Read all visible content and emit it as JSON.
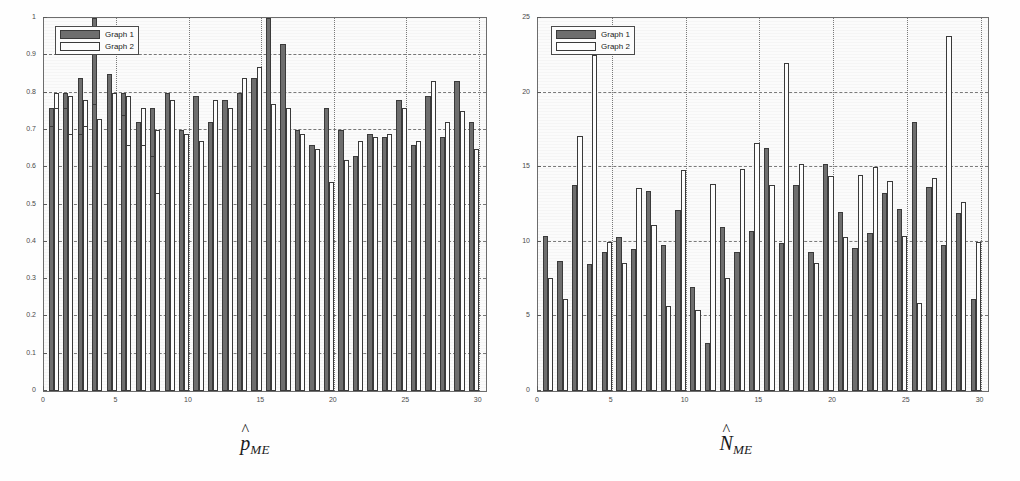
{
  "figure": {
    "background": "#fefefe",
    "series_colors": {
      "graph1": "#6e6e6e",
      "graph2": "#fdfdfd"
    },
    "grid_color": "#7a7a7a",
    "axis_color": "#6d6d6d"
  },
  "legend": {
    "entries": [
      {
        "label": "Graph 1",
        "key": "s1"
      },
      {
        "label": "Graph 2",
        "key": "s2"
      }
    ]
  },
  "panels": [
    {
      "id": "left",
      "caption_symbol": "p",
      "caption_hat": "^",
      "caption_sub": "ME"
    },
    {
      "id": "right",
      "caption_symbol": "N",
      "caption_hat": "^",
      "caption_sub": "ME"
    }
  ],
  "chart_data": [
    {
      "type": "bar",
      "id": "p-hat-me",
      "title": "",
      "xlabel": "",
      "ylabel": "",
      "xlim": [
        0,
        30.5
      ],
      "ylim": [
        0,
        1
      ],
      "xticks": [
        0,
        5,
        10,
        15,
        20,
        25,
        30
      ],
      "yticks": [
        0,
        0.1,
        0.2,
        0.3,
        0.4,
        0.5,
        0.6,
        0.7,
        0.8,
        0.9,
        1
      ],
      "xtick_labels": [
        "0",
        "5",
        "10",
        "15",
        "20",
        "25",
        "30"
      ],
      "ytick_labels": [
        "0",
        "0.1",
        "0.2",
        "0.3",
        "0.4",
        "0.5",
        "0.6",
        "0.7",
        "0.8",
        "0.9",
        "1"
      ],
      "grid": true,
      "legend_position": "upper-left",
      "categories": [
        1,
        2,
        3,
        4,
        5,
        6,
        7,
        8,
        9,
        10,
        11,
        12,
        13,
        14,
        15,
        16,
        17,
        18,
        19,
        20,
        21,
        22,
        23,
        24,
        25,
        26,
        27,
        28,
        29,
        30
      ],
      "series": [
        {
          "name": "Graph 1",
          "color": "#6e6e6e",
          "values": [
            0.76,
            0.8,
            0.84,
            1.0,
            0.66,
            0.8,
            0.59,
            0.76,
            0.71,
            0.7,
            0.79,
            0.72,
            0.78,
            0.8,
            0.84,
            1.0,
            0.93,
            0.7,
            0.66,
            0.76,
            0.7,
            0.63,
            0.69,
            0.68,
            0.78,
            0.66,
            0.79,
            0.68,
            0.83,
            0.72,
            0.71,
            0.76,
            0.69,
            0.77,
            0.85,
            0.74,
            0.72,
            0.63,
            0.8,
            0.7
          ]
        },
        {
          "name": "Graph 2",
          "color": "#fdfdfd",
          "values": [
            0.8,
            0.79,
            0.78,
            0.67,
            0.58,
            0.79,
            0.76,
            0.7,
            0.69,
            0.67,
            0.67,
            0.78,
            0.76,
            0.84,
            0.87,
            0.77,
            0.76,
            0.69,
            0.65,
            0.56,
            0.62,
            0.67,
            0.68,
            0.69,
            0.76,
            0.67,
            0.83,
            0.72,
            0.75,
            0.65,
            0.76,
            0.69,
            0.71,
            0.73,
            0.8,
            0.66,
            0.66,
            0.53,
            0.78,
            0.69
          ]
        }
      ]
    },
    {
      "type": "bar",
      "id": "n-hat-me",
      "title": "",
      "xlabel": "",
      "ylabel": "",
      "xlim": [
        0,
        30.5
      ],
      "ylim": [
        0,
        25
      ],
      "xticks": [
        0,
        5,
        10,
        15,
        20,
        25,
        30
      ],
      "yticks": [
        0,
        5,
        10,
        15,
        20,
        25
      ],
      "xtick_labels": [
        "0",
        "5",
        "10",
        "15",
        "20",
        "25",
        "30"
      ],
      "ytick_labels": [
        "0",
        "5",
        "10",
        "15",
        "20",
        "25"
      ],
      "grid": true,
      "legend_position": "upper-left",
      "categories": [
        1,
        2,
        3,
        4,
        5,
        6,
        7,
        8,
        9,
        10,
        11,
        12,
        13,
        14,
        15,
        16,
        17,
        18,
        19,
        20,
        21,
        22,
        23,
        24,
        25,
        26,
        27,
        28,
        29,
        30
      ],
      "series": [
        {
          "name": "Graph 1",
          "color": "#6e6e6e",
          "values": [
            9.9,
            7.6,
            8.0,
            5.0,
            9.3,
            10.3,
            9.5,
            13.4,
            9.8,
            12.1,
            7.0,
            3.2,
            11.0,
            9.3,
            10.7,
            16.3,
            9.9,
            13.8,
            9.3,
            15.2,
            12.0,
            9.6,
            10.6,
            13.3,
            12.2,
            18.0,
            13.7,
            9.8,
            11.9,
            6.2,
            10.4,
            8.7,
            13.8,
            8.5
          ]
        },
        {
          "name": "Graph 2",
          "color": "#fdfdfd",
          "values": [
            7.6,
            6.2,
            17.1,
            22.5,
            10.0,
            8.6,
            13.6,
            11.1,
            5.7,
            14.8,
            5.4,
            13.9,
            7.6,
            14.9,
            16.6,
            13.8,
            22.0,
            15.2,
            8.6,
            14.4,
            10.3,
            14.5,
            15.0,
            14.1,
            10.4,
            5.9,
            14.3,
            23.8,
            12.7,
            10.0
          ]
        }
      ]
    }
  ]
}
